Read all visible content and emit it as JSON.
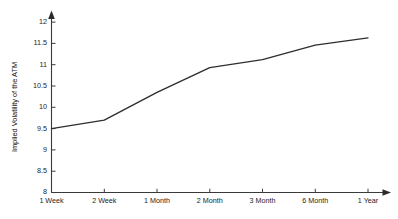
{
  "chart_data": {
    "type": "line",
    "title": "",
    "subtitle": "",
    "xlabel": "",
    "ylabel": "Implied Volatility of the ATM",
    "categories": [
      "1 Week",
      "2 Week",
      "1 Month",
      "2 Month",
      "3 Month",
      "6 Month",
      "1 Year"
    ],
    "values": [
      9.5,
      9.7,
      10.35,
      10.93,
      11.12,
      11.46,
      11.63
    ],
    "series": [
      {
        "name": "Implied Volatility of the ATM",
        "values": [
          9.5,
          9.7,
          10.35,
          10.93,
          11.12,
          11.46,
          11.63
        ]
      }
    ],
    "ylim": [
      8,
      12
    ],
    "ytick_labels": [
      "8",
      "8.5",
      "9",
      "9.5",
      "10",
      "10.5",
      "11",
      "11.5",
      "12"
    ],
    "ytick_values": [
      8,
      8.5,
      9,
      9.5,
      10,
      10.5,
      11,
      11.5,
      12
    ],
    "xtick_labels": [
      "1 Week",
      "2 Week",
      "1 Month",
      "2 Month",
      "3 Month",
      "6 Month",
      "1 Year"
    ],
    "grid": false,
    "legend": false,
    "legend_position": "none",
    "annotations": [],
    "line_color": "#2e2e2e",
    "background_color": "#ffffff",
    "axis_color": "#3a3a3a",
    "x_axis_arrow": true,
    "y_axis_arrow": true
  }
}
